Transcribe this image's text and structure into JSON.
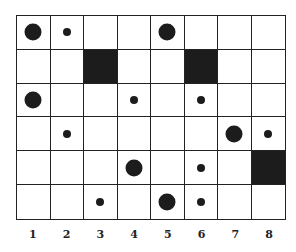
{
  "grid": {
    "columns": 8,
    "rows": 6,
    "column_labels": [
      "1",
      "2",
      "3",
      "4",
      "5",
      "6",
      "7",
      "8"
    ],
    "cells": [
      [
        "large",
        "small",
        "",
        "",
        "large",
        "",
        "",
        ""
      ],
      [
        "",
        "",
        "black",
        "",
        "",
        "black",
        "",
        ""
      ],
      [
        "large",
        "",
        "",
        "small",
        "",
        "small",
        "",
        ""
      ],
      [
        "",
        "small",
        "",
        "",
        "",
        "",
        "large",
        "small"
      ],
      [
        "",
        "",
        "",
        "large",
        "",
        "small",
        "",
        "black"
      ],
      [
        "",
        "",
        "small",
        "",
        "large",
        "small",
        "",
        ""
      ]
    ]
  }
}
